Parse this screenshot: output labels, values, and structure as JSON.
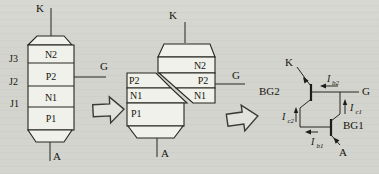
{
  "colors": {
    "background": "#d3d4cd",
    "line": "#26261f",
    "block_fill": "#f0f1ea"
  },
  "layer_stack": {
    "cathode": "K",
    "anode": "A",
    "gate": "G",
    "layers": [
      "N2",
      "P2",
      "N1",
      "P1"
    ],
    "junctions": [
      "J3",
      "J2",
      "J1"
    ]
  },
  "split_stack": {
    "cathode": "K",
    "anode": "A",
    "gate": "G",
    "upper_layers": [
      "N2",
      "P2",
      "N1"
    ],
    "lower_layers": [
      "P2",
      "N1",
      "P1"
    ]
  },
  "circuit": {
    "cathode": "K",
    "anode": "A",
    "gate": "G",
    "transistor_upper": "BG2",
    "transistor_lower": "BG1",
    "currents": {
      "ib2": {
        "sym": "I",
        "sub": "b2"
      },
      "ic1": {
        "sym": "I",
        "sub": "c1"
      },
      "ic2": {
        "sym": "I",
        "sub": "c2"
      },
      "ib1": {
        "sym": "I",
        "sub": "b1"
      }
    }
  }
}
